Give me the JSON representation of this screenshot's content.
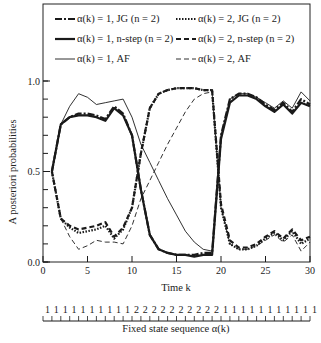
{
  "chart_data": {
    "type": "line",
    "title": "",
    "xlabel": "Time k",
    "ylabel": "A posteriori probabilities",
    "xlim": [
      0,
      30
    ],
    "ylim": [
      0,
      1.0
    ],
    "x_ticks": [
      0,
      5,
      10,
      15,
      20,
      25,
      30
    ],
    "x_tick_labels": [
      "0",
      "5",
      "10",
      "15",
      "20",
      "25",
      "30"
    ],
    "y_ticks": [
      0.0,
      0.5,
      1.0
    ],
    "y_tick_labels": [
      "0.0",
      "0.5",
      "1.0"
    ],
    "y_minor_step": 0.1,
    "grid": false,
    "legend_placement": "top (inside plot box, two columns)",
    "x": [
      1,
      2,
      3,
      4,
      5,
      6,
      7,
      8,
      9,
      10,
      11,
      12,
      13,
      14,
      15,
      16,
      17,
      18,
      19,
      20,
      21,
      22,
      23,
      24,
      25,
      26,
      27,
      28,
      29,
      30
    ],
    "series": [
      {
        "name": "α(k) = 1, JG (n = 2)",
        "style": "dash-dot",
        "weight": "heavy",
        "values": [
          0.5,
          0.76,
          0.8,
          0.82,
          0.82,
          0.81,
          0.79,
          0.86,
          0.82,
          0.7,
          0.4,
          0.15,
          0.07,
          0.05,
          0.04,
          0.04,
          0.04,
          0.05,
          0.05,
          0.7,
          0.9,
          0.93,
          0.93,
          0.91,
          0.87,
          0.84,
          0.88,
          0.83,
          0.9,
          0.87
        ]
      },
      {
        "name": "α(k) = 2, JG (n = 2)",
        "style": "dotted",
        "weight": "heavy",
        "values": [
          0.5,
          0.24,
          0.19,
          0.16,
          0.17,
          0.18,
          0.2,
          0.13,
          0.18,
          0.3,
          0.6,
          0.85,
          0.93,
          0.95,
          0.96,
          0.96,
          0.96,
          0.95,
          0.95,
          0.3,
          0.1,
          0.07,
          0.07,
          0.09,
          0.13,
          0.16,
          0.12,
          0.17,
          0.1,
          0.13
        ]
      },
      {
        "name": "α(k) = 1, n-step (n = 2)",
        "style": "solid",
        "weight": "heavy",
        "values": [
          0.5,
          0.76,
          0.8,
          0.81,
          0.81,
          0.8,
          0.78,
          0.85,
          0.81,
          0.7,
          0.4,
          0.15,
          0.07,
          0.05,
          0.04,
          0.04,
          0.03,
          0.04,
          0.04,
          0.68,
          0.88,
          0.92,
          0.92,
          0.9,
          0.86,
          0.83,
          0.87,
          0.82,
          0.88,
          0.86
        ]
      },
      {
        "name": "α(k) = 2, n-step (n = 2)",
        "style": "dashed",
        "weight": "heavy",
        "values": [
          0.5,
          0.24,
          0.2,
          0.18,
          0.19,
          0.2,
          0.22,
          0.14,
          0.19,
          0.3,
          0.6,
          0.85,
          0.93,
          0.95,
          0.96,
          0.96,
          0.96,
          0.95,
          0.95,
          0.32,
          0.12,
          0.08,
          0.08,
          0.1,
          0.14,
          0.17,
          0.13,
          0.18,
          0.12,
          0.14
        ]
      },
      {
        "name": "α(k) = 1, AF",
        "style": "solid",
        "weight": "light",
        "values": [
          0.5,
          0.76,
          0.86,
          0.93,
          0.91,
          0.87,
          0.88,
          0.89,
          0.9,
          0.8,
          0.65,
          0.55,
          0.45,
          0.35,
          0.26,
          0.17,
          0.11,
          0.07,
          0.06,
          0.7,
          0.9,
          0.93,
          0.93,
          0.91,
          0.88,
          0.85,
          0.89,
          0.85,
          0.94,
          0.89
        ]
      },
      {
        "name": "α(k) = 2, AF",
        "style": "dashed",
        "weight": "light",
        "values": [
          0.5,
          0.24,
          0.14,
          0.07,
          0.09,
          0.12,
          0.11,
          0.11,
          0.1,
          0.2,
          0.35,
          0.45,
          0.55,
          0.65,
          0.74,
          0.83,
          0.9,
          0.93,
          0.94,
          0.3,
          0.1,
          0.07,
          0.07,
          0.09,
          0.12,
          0.15,
          0.11,
          0.15,
          0.06,
          0.11
        ]
      }
    ],
    "state_sequence": {
      "label": "Fixed state sequence α(k)",
      "values": [
        1,
        1,
        1,
        1,
        1,
        1,
        1,
        1,
        1,
        1,
        2,
        2,
        2,
        2,
        2,
        2,
        2,
        2,
        2,
        2,
        1,
        1,
        1,
        1,
        1,
        1,
        1,
        1,
        1,
        1,
        1
      ]
    }
  },
  "legend": {
    "items": [
      {
        "text": "α(k) = 1, JG (n = 2)"
      },
      {
        "text": "α(k) = 2, JG (n = 2)"
      },
      {
        "text": "α(k) = 1, n-step (n = 2)"
      },
      {
        "text": "α(k) = 2, n-step (n = 2)"
      },
      {
        "text": "α(k) = 1, AF"
      },
      {
        "text": "α(k) = 2, AF"
      }
    ]
  },
  "colors": {
    "ink": "#1a1a1a",
    "background": "#ffffff"
  }
}
